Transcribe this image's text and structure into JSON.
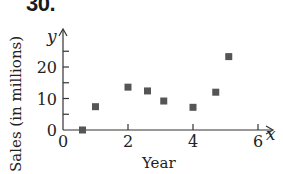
{
  "problem_number": "30.",
  "chart_data": {
    "type": "scatter",
    "title": "",
    "xlabel": "Year",
    "ylabel": "Sales (in millions)",
    "x_axis_var": "x",
    "y_axis_var": "y",
    "xlim": [
      0,
      6.5
    ],
    "ylim": [
      0,
      27
    ],
    "x_ticks": [
      0,
      2,
      4,
      6
    ],
    "x_tick_labels": [
      "0",
      "2",
      "4",
      "6"
    ],
    "y_ticks": [
      0,
      5,
      10,
      15,
      20,
      25
    ],
    "y_tick_labels": [
      "0",
      "10",
      "20"
    ],
    "grid": false,
    "legend": null,
    "marker": "square",
    "marker_color": "#555555",
    "points": [
      {
        "x": 0.6,
        "y": 0
      },
      {
        "x": 1.0,
        "y": 7.4
      },
      {
        "x": 2.0,
        "y": 13.6
      },
      {
        "x": 2.6,
        "y": 12.4
      },
      {
        "x": 3.1,
        "y": 9.2
      },
      {
        "x": 4.0,
        "y": 7.2
      },
      {
        "x": 4.7,
        "y": 12.0
      },
      {
        "x": 5.1,
        "y": 23.3
      }
    ]
  }
}
